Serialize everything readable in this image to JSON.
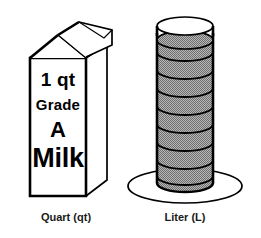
{
  "figure": {
    "background_color": "#ffffff",
    "line_color": "#000000",
    "fill_gray": "#9a9a9a"
  },
  "carton": {
    "label_lines": {
      "quantity": "1 qt",
      "grade_word": "Grade",
      "grade_letter": "A",
      "product": "Milk"
    },
    "caption": "Quart (qt)"
  },
  "cylinder": {
    "caption": "Liter (L)",
    "graduation_count": 8,
    "fill_color": "#9a9a9a"
  }
}
